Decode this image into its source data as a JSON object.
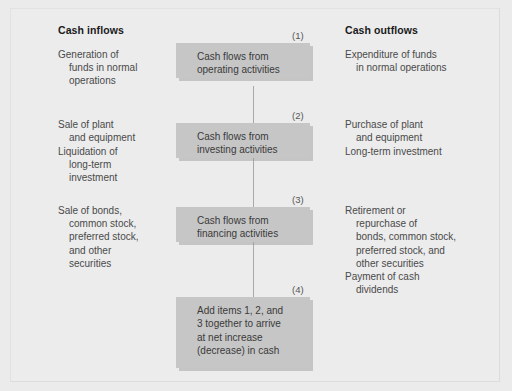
{
  "diagram": {
    "columns": {
      "inflows": {
        "header": "Cash inflows",
        "items": [
          "Generation of\nfunds in normal\noperations",
          "Sale of plant\nand equipment",
          "Liquidation of\nlong-term\ninvestment",
          "Sale of bonds,\ncommon stock,\npreferred stock,\nand other\nsecurities"
        ]
      },
      "outflows": {
        "header": "Cash outflows",
        "items": [
          "Expenditure of funds\nin normal operations",
          "Purchase of plant\nand equipment",
          "Long-term investment",
          "Retirement or\nrepurchase of\nbonds, common stock,\npreferred stock, and\nother securities",
          "Payment of cash\ndividends"
        ]
      }
    },
    "nodes": [
      {
        "number": "(1)",
        "label": "Cash flows from\noperating activities"
      },
      {
        "number": "(2)",
        "label": "Cash flows from\ninvesting activities"
      },
      {
        "number": "(3)",
        "label": "Cash flows from\nfinancing activities"
      },
      {
        "number": "(4)",
        "label": "Add items 1, 2, and\n3 together to arrive\nat net increase\n(decrease) in cash"
      }
    ],
    "colors": {
      "page_background": "#ebebeb",
      "node_fill": "#c6c6c6",
      "connector_line": "#a9a9a9",
      "body_text": "#4a4a4a",
      "header_text": "#1a1a1a"
    }
  }
}
